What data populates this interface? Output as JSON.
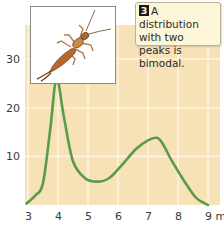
{
  "chart_data": {
    "type": "line",
    "title": "",
    "xlabel": "",
    "ylabel": "",
    "x_unit": "mm",
    "x_ticks": [
      3,
      4,
      5,
      6,
      7,
      8,
      9
    ],
    "x_tick_labels": [
      "3",
      "4",
      "5",
      "6",
      "7",
      "8",
      "9 mm"
    ],
    "y_ticks": [
      10,
      20,
      30
    ],
    "y_tick_labels": [
      "10",
      "20",
      "30"
    ],
    "xlim": [
      2.9,
      9.4
    ],
    "ylim": [
      0,
      37
    ],
    "grid": true,
    "series": [
      {
        "name": "frequency",
        "color": "#5a9a48",
        "x": [
          2.95,
          3.25,
          3.5,
          3.75,
          3.95,
          4.2,
          4.5,
          4.9,
          5.3,
          5.7,
          6.1,
          6.6,
          7.0,
          7.3,
          7.5,
          7.8,
          8.2,
          8.6,
          9.0
        ],
        "y": [
          0.3,
          2,
          4.5,
          16,
          26,
          18,
          9,
          5.5,
          4.8,
          5.5,
          8,
          11.5,
          13.3,
          13.8,
          12.5,
          9,
          5,
          1.5,
          0
        ]
      }
    ],
    "annotations": [
      {
        "badge": "3",
        "text": "A distribution with two peaks is bimodal."
      }
    ]
  },
  "caption": {
    "badge": "3",
    "lines": [
      "A distribution",
      "with two",
      "peaks is bimodal."
    ]
  },
  "colors": {
    "plot_background": "#f7e2b8",
    "grid": "#fdf3de",
    "line": "#5a9a48"
  },
  "photo": {
    "subject": "earwig-illustration"
  }
}
